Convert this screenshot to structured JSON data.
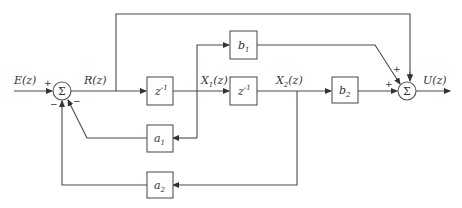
{
  "diagram": {
    "type": "block-diagram",
    "signals": {
      "input": "E(z)",
      "internal": "R(z)",
      "state1": "X1(z)",
      "state2": "X2(z)",
      "output": "U(z)"
    },
    "blocks": {
      "delay1": {
        "base": "z",
        "sup": "-1"
      },
      "delay2": {
        "base": "z",
        "sup": "-1"
      },
      "b1": {
        "base": "b",
        "sub": "1"
      },
      "b2": {
        "base": "b",
        "sub": "2"
      },
      "a1": {
        "base": "a",
        "sub": "1"
      },
      "a2": {
        "base": "a",
        "sub": "2"
      }
    },
    "summers": {
      "sum1": {
        "symbol": "Σ",
        "signs": {
          "input": "+",
          "fb_a2": "−",
          "fb_a1": "−"
        }
      },
      "sum2": {
        "symbol": "Σ",
        "signs": {
          "b2": "+",
          "b1": "+",
          "direct": "+"
        }
      }
    },
    "labels": {
      "E": "E(z)",
      "R": "R(z)",
      "X1_base": "X",
      "X1_sub": "1",
      "X1_tail": "(z)",
      "X2_base": "X",
      "X2_sub": "2",
      "X2_tail": "(z)",
      "U": "U(z)"
    }
  }
}
